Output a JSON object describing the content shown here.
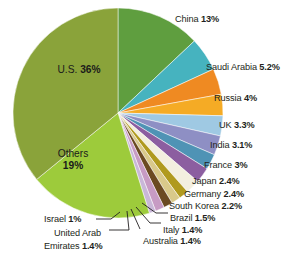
{
  "chart_data": {
    "type": "pie",
    "title": "",
    "xlabel": "",
    "ylabel": "",
    "unit": "%",
    "legend_position": "callout-labels",
    "grid": false,
    "categories": [
      "China",
      "Saudi Arabia",
      "Russia",
      "UK",
      "India",
      "France",
      "Japan",
      "Germany",
      "South Korea",
      "Brazil",
      "Italy",
      "Australia",
      "United Arab Emirates",
      "Israel",
      "Others",
      "U.S."
    ],
    "values": [
      13,
      5.2,
      4,
      3.3,
      3.1,
      3,
      2.4,
      2.4,
      2.2,
      1.5,
      1.4,
      1.4,
      1.4,
      1,
      19,
      36
    ],
    "value_labels": [
      "13%",
      "5.2%",
      "4%",
      "3.3%",
      "3.1%",
      "3%",
      "2.4%",
      "2.4%",
      "2.2%",
      "1.5%",
      "1.4%",
      "1.4%",
      "1.4%",
      "1%",
      "19%",
      "36%"
    ],
    "colors": [
      "#5f9e3f",
      "#46b3bf",
      "#ef8a22",
      "#f5ab25",
      "#9fc9e3",
      "#8e8fc4",
      "#4f93b5",
      "#8c5ea0",
      "#f3efdf",
      "#b09a1e",
      "#d9c98a",
      "#6b4a22",
      "#c79bc4",
      "#c9b7d8",
      "#9dcb3b",
      "#8aa33a"
    ]
  },
  "pie": {
    "center_x": 118,
    "center_y": 113,
    "radius": 105,
    "start_angle_deg": -90,
    "direction": "clockwise"
  },
  "slices": [
    {
      "name": "China",
      "label": "China",
      "value": "13%",
      "color": "#5f9e3f"
    },
    {
      "name": "Saudi Arabia",
      "label": "Saudi Arabia",
      "value": "5.2%",
      "color": "#46b3bf"
    },
    {
      "name": "Russia",
      "label": "Russia",
      "value": "4%",
      "color": "#ef8a22"
    },
    {
      "name": "UK",
      "label": "UK",
      "value": "3.3%",
      "color": "#f5ab25"
    },
    {
      "name": "India",
      "label": "India",
      "value": "3.1%",
      "color": "#9fc9e3"
    },
    {
      "name": "France",
      "label": "France",
      "value": "3%",
      "color": "#8e8fc4"
    },
    {
      "name": "Japan",
      "label": "Japan",
      "value": "2.4%",
      "color": "#4f93b5"
    },
    {
      "name": "Germany",
      "label": "Germany",
      "value": "2.4%",
      "color": "#8c5ea0"
    },
    {
      "name": "South Korea",
      "label": "South Korea",
      "value": "2.2%",
      "color": "#f3efdf"
    },
    {
      "name": "Brazil",
      "label": "Brazil",
      "value": "1.5%",
      "color": "#b09a1e"
    },
    {
      "name": "Italy",
      "label": "Italy",
      "value": "1.4%",
      "color": "#d9c98a"
    },
    {
      "name": "Australia",
      "label": "Australia",
      "value": "1.4%",
      "color": "#6b4a22"
    },
    {
      "name": "United Arab Emirates",
      "label": "United Arab Emirates",
      "value": "1.4%",
      "color": "#c79bc4"
    },
    {
      "name": "Israel",
      "label": "Israel",
      "value": "1%",
      "color": "#c9b7d8"
    },
    {
      "name": "Others",
      "label": "Others",
      "value": "19%",
      "color": "#9dcb3b"
    },
    {
      "name": "U.S.",
      "label": "U.S.",
      "value": "36%",
      "color": "#8aa33a"
    }
  ],
  "labels": {
    "china": "China",
    "china_value": "13%",
    "saudi": "Saudi Arabia",
    "saudi_value": "5.2%",
    "russia": "Russia",
    "russia_value": "4%",
    "uk": "UK",
    "uk_value": "3.3%",
    "india": "India",
    "india_value": "3.1%",
    "france": "France",
    "france_value": "3%",
    "japan": "Japan",
    "japan_value": "2.4%",
    "germany": "Germany",
    "germany_value": "2.4%",
    "south_korea": "South Korea",
    "south_korea_value": "2.2%",
    "brazil": "Brazil",
    "brazil_value": "1.5%",
    "italy": "Italy",
    "italy_value": "1.4%",
    "australia": "Australia",
    "australia_value": "1.4%",
    "israel": "Israel",
    "israel_value": "1%",
    "uae_line1": "United Arab",
    "uae_line2": "Emirates",
    "uae_value": "1.4%",
    "us": "U.S.",
    "us_value": "36%",
    "others": "Others",
    "others_value": "19%"
  }
}
